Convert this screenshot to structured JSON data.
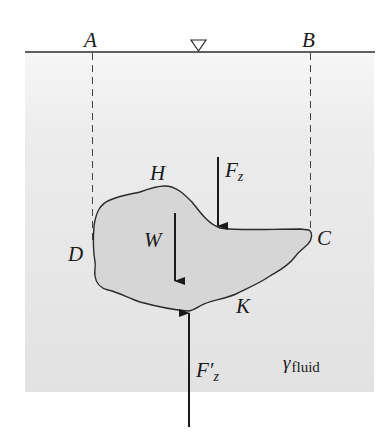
{
  "diagram": {
    "type": "buoyancy-free-body",
    "colors": {
      "fluid_top": "#f2f2f2",
      "fluid_bottom": "#e3e3e3",
      "body_fill": "#d9d9d9",
      "line": "#2a2a2a"
    },
    "labels": {
      "point_a": "A",
      "point_b": "B",
      "point_c": "C",
      "point_d": "D",
      "point_h": "H",
      "point_k": "K",
      "weight": "W",
      "force_top_main": "F",
      "force_top_sub": "z",
      "force_bottom_main": "F′",
      "force_bottom_sub": "z",
      "fluid_symbol": "γ",
      "fluid_sub": "fluid"
    },
    "elements": {
      "free_surface": "free surface line with ▽ symbol",
      "projection_lines": [
        "dashed vertical from A",
        "dashed vertical from B"
      ],
      "arrows": [
        "F_z downward on top surface",
        "W downward through body",
        "F'_z upward on bottom surface"
      ]
    }
  }
}
